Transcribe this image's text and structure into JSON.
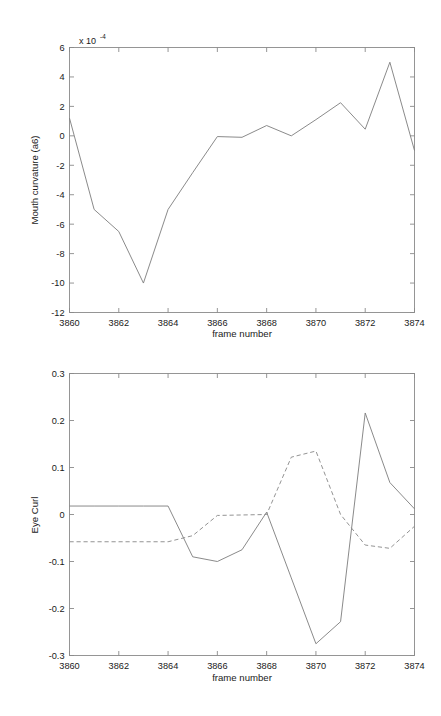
{
  "figure": {
    "background": "#ffffff",
    "line_color": "#7d7d7d",
    "axis_color": "#8a8a8a"
  },
  "chart_data": [
    {
      "type": "line",
      "id": "mouth-curvature",
      "title": "",
      "xlabel": "frame number",
      "ylabel": "Mouth curvature (a6)",
      "exponent_label": "x 10",
      "exponent_power": "-4",
      "xlim": [
        3860,
        3874
      ],
      "ylim": [
        -12,
        6
      ],
      "xticks": [
        3860,
        3862,
        3864,
        3866,
        3868,
        3870,
        3872,
        3874
      ],
      "xticklabels": [
        "3860",
        "3862",
        "3864",
        "3866",
        "3868",
        "3870",
        "3872",
        "3874"
      ],
      "yticks": [
        6,
        4,
        2,
        0,
        -2,
        -4,
        -6,
        -8,
        -10,
        -12
      ],
      "yticklabels": [
        "6",
        "4",
        "2",
        "0",
        "-2",
        "-4",
        "-6",
        "-8",
        "-10",
        "-12"
      ],
      "grid": false,
      "legend": "none",
      "x": [
        3860,
        3861,
        3862,
        3863,
        3864,
        3865,
        3866,
        3867,
        3868,
        3869,
        3870,
        3871,
        3872,
        3873,
        3874
      ],
      "series": [
        {
          "name": "mouth curvature",
          "style": "solid",
          "values": [
            1.2,
            -5.0,
            -6.5,
            -10.0,
            -5.0,
            -2.5,
            -0.05,
            -0.1,
            0.7,
            0.0,
            1.1,
            2.25,
            0.45,
            5.0,
            -1.0
          ]
        }
      ]
    },
    {
      "type": "line",
      "id": "eye-curl",
      "title": "",
      "xlabel": "frame number",
      "ylabel": "Eye Curl",
      "xlim": [
        3860,
        3874
      ],
      "ylim": [
        -0.3,
        0.3
      ],
      "xticks": [
        3860,
        3862,
        3864,
        3866,
        3868,
        3870,
        3872,
        3874
      ],
      "xticklabels": [
        "3860",
        "3862",
        "3864",
        "3866",
        "3868",
        "3870",
        "3872",
        "3874"
      ],
      "yticks": [
        0.3,
        0.2,
        0.1,
        0,
        -0.1,
        -0.2,
        -0.3
      ],
      "yticklabels": [
        "0.3",
        "0.2",
        "0.1",
        "0",
        "-0.1",
        "-0.2",
        "-0.3"
      ],
      "grid": false,
      "legend": "none",
      "x": [
        3860,
        3861,
        3862,
        3863,
        3864,
        3865,
        3866,
        3867,
        3868,
        3869,
        3870,
        3871,
        3872,
        3873,
        3874
      ],
      "series": [
        {
          "name": "eye curl solid",
          "style": "solid",
          "values": [
            0.018,
            0.018,
            0.018,
            0.018,
            0.018,
            -0.09,
            -0.1,
            -0.075,
            0.005,
            -0.135,
            -0.275,
            -0.228,
            0.216,
            0.068,
            0.012
          ]
        },
        {
          "name": "eye curl dashed",
          "style": "dashed",
          "values": [
            -0.058,
            -0.058,
            -0.058,
            -0.058,
            -0.058,
            -0.045,
            -0.002,
            -0.001,
            0.0,
            0.122,
            0.135,
            0.0,
            -0.065,
            -0.072,
            -0.025
          ]
        }
      ]
    }
  ]
}
